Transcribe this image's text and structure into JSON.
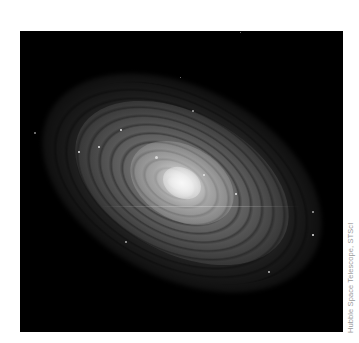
{
  "image": {
    "subject": "spiral galaxy",
    "description": "Grayscale Hubble image of a tilted spiral galaxy on a black background",
    "background_color": "#000000",
    "core_color": "#f0f0f0"
  },
  "credit": {
    "text": "Hubble Space Telescope, STScI",
    "color": "#9a9a9a"
  }
}
